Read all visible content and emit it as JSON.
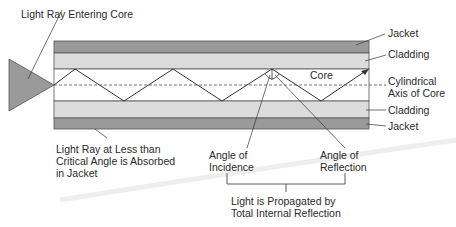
{
  "diagram": {
    "title_label": "Light Ray Entering Core",
    "layers": {
      "jacket_top": "Jacket",
      "cladding_top": "Cladding",
      "core": "Core",
      "axis": "Cylindrical\nAxis of Core",
      "cladding_bottom": "Cladding",
      "jacket_bottom": "Jacket"
    },
    "absorbed_label": "Light Ray at Less than\nCritical Angle is Absorbed\nin Jacket",
    "angle_incidence": "Angle of\nIncidence",
    "angle_reflection": "Angle of\nReflection",
    "propagation_label": "Light is Propagated by\nTotal Internal Reflection",
    "colors": {
      "jacket": "#9a9a9a",
      "cladding": "#dcdcdc",
      "core": "#ffffff",
      "source": "#9a9a9a",
      "line": "#333333"
    }
  }
}
